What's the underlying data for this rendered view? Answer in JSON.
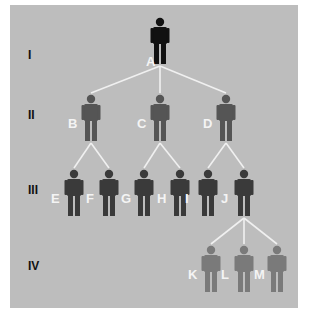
{
  "diagram": {
    "type": "pedigree-tree",
    "colors": {
      "background": "#bdbdbd",
      "gen1": "#111111",
      "gen2": "#555555",
      "gen3": "#3a3a3a",
      "gen4": "#7a7a7a",
      "lines": "#f0f0f0",
      "labels": "#f4f4f4"
    },
    "generations": [
      {
        "label": "I",
        "y": 55
      },
      {
        "label": "II",
        "y": 115
      },
      {
        "label": "III",
        "y": 190
      },
      {
        "label": "IV",
        "y": 266
      }
    ],
    "people": [
      {
        "id": "A",
        "gen": 1,
        "x": 160,
        "y": 18
      },
      {
        "id": "B",
        "gen": 2,
        "x": 91,
        "y": 95
      },
      {
        "id": "C",
        "gen": 2,
        "x": 160,
        "y": 95
      },
      {
        "id": "D",
        "gen": 2,
        "x": 226,
        "y": 95
      },
      {
        "id": "E",
        "gen": 3,
        "x": 74,
        "y": 170
      },
      {
        "id": "F",
        "gen": 3,
        "x": 109,
        "y": 170
      },
      {
        "id": "G",
        "gen": 3,
        "x": 144,
        "y": 170
      },
      {
        "id": "H",
        "gen": 3,
        "x": 180,
        "y": 170
      },
      {
        "id": "I",
        "gen": 3,
        "x": 208,
        "y": 170
      },
      {
        "id": "J",
        "gen": 3,
        "x": 244,
        "y": 170
      },
      {
        "id": "K",
        "gen": 4,
        "x": 211,
        "y": 246
      },
      {
        "id": "L",
        "gen": 4,
        "x": 244,
        "y": 246
      },
      {
        "id": "M",
        "gen": 4,
        "x": 277,
        "y": 246
      }
    ],
    "edges": [
      [
        "A",
        "B"
      ],
      [
        "A",
        "C"
      ],
      [
        "A",
        "D"
      ],
      [
        "B",
        "E"
      ],
      [
        "B",
        "F"
      ],
      [
        "C",
        "G"
      ],
      [
        "C",
        "H"
      ],
      [
        "D",
        "I"
      ],
      [
        "D",
        "J"
      ],
      [
        "J",
        "K"
      ],
      [
        "J",
        "L"
      ],
      [
        "J",
        "M"
      ]
    ]
  }
}
